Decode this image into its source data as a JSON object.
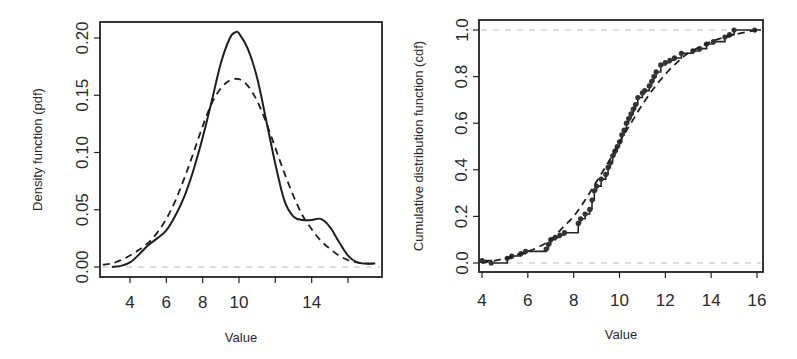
{
  "chart_data": [
    {
      "type": "line",
      "title": "",
      "xlabel": "Value",
      "ylabel": "Density function (pdf)",
      "xlim": [
        2.4,
        18.0
      ],
      "ylim": [
        -0.01,
        0.215
      ],
      "x_ticks": [
        "4",
        "6",
        "8",
        "10",
        "",
        "14",
        ""
      ],
      "x_tick_values": [
        4,
        6,
        8,
        10,
        12,
        14,
        16
      ],
      "y_ticks": [
        "0.00",
        "0.05",
        "0.10",
        "0.15",
        "0.20"
      ],
      "y_tick_values": [
        0.0,
        0.05,
        0.1,
        0.15,
        0.2
      ],
      "grid": false,
      "legend": null,
      "reference_lines": [
        {
          "y": 0.0,
          "style": "dashed",
          "color": "#bbbbbb"
        }
      ],
      "series": [
        {
          "name": "Kernel density (empirical)",
          "style": "solid",
          "x": [
            3.0,
            3.5,
            4.0,
            4.5,
            5.0,
            5.5,
            6.0,
            6.5,
            7.0,
            7.5,
            8.0,
            8.5,
            9.0,
            9.5,
            9.8,
            10.0,
            10.5,
            11.0,
            11.5,
            12.0,
            12.5,
            13.0,
            13.5,
            14.0,
            14.5,
            15.0,
            15.5,
            16.0,
            16.5,
            17.0,
            17.5
          ],
          "values": [
            0.0,
            0.001,
            0.004,
            0.011,
            0.019,
            0.025,
            0.032,
            0.045,
            0.062,
            0.085,
            0.113,
            0.145,
            0.178,
            0.2,
            0.205,
            0.204,
            0.19,
            0.165,
            0.128,
            0.09,
            0.058,
            0.044,
            0.041,
            0.041,
            0.042,
            0.035,
            0.022,
            0.01,
            0.004,
            0.003,
            0.003
          ]
        },
        {
          "name": "Fitted normal density",
          "style": "dashed",
          "x": [
            2.5,
            3.0,
            3.5,
            4.0,
            4.5,
            5.0,
            5.5,
            6.0,
            6.5,
            7.0,
            7.5,
            8.0,
            8.5,
            9.0,
            9.5,
            10.0,
            10.5,
            11.0,
            11.5,
            12.0,
            12.5,
            13.0,
            13.5,
            14.0,
            14.5,
            15.0,
            15.5,
            16.0,
            16.5,
            17.0,
            17.5
          ],
          "values": [
            0.002,
            0.003,
            0.006,
            0.01,
            0.015,
            0.021,
            0.03,
            0.042,
            0.058,
            0.078,
            0.1,
            0.123,
            0.143,
            0.156,
            0.163,
            0.164,
            0.158,
            0.145,
            0.126,
            0.104,
            0.082,
            0.062,
            0.045,
            0.033,
            0.023,
            0.016,
            0.01,
            0.006,
            0.004,
            0.003,
            0.003
          ]
        }
      ]
    },
    {
      "type": "line",
      "title": "",
      "xlabel": "Value",
      "ylabel": "Cumulative distribution function (cdf)",
      "xlim": [
        3.9,
        16.2
      ],
      "ylim": [
        -0.04,
        1.04
      ],
      "x_ticks": [
        "4",
        "6",
        "8",
        "10",
        "12",
        "14",
        "16"
      ],
      "x_tick_values": [
        4,
        6,
        8,
        10,
        12,
        14,
        16
      ],
      "y_ticks": [
        "0.0",
        "0.2",
        "0.4",
        "0.6",
        "0.8",
        "1.0"
      ],
      "y_tick_values": [
        0.0,
        0.2,
        0.4,
        0.6,
        0.8,
        1.0
      ],
      "grid": false,
      "legend": null,
      "reference_lines": [
        {
          "y": 0.0,
          "style": "dashed",
          "color": "#bbbbbb"
        },
        {
          "y": 1.0,
          "style": "dashed",
          "color": "#bbbbbb"
        }
      ],
      "series": [
        {
          "name": "Empirical CDF (step with points)",
          "style": "step-points",
          "x": [
            4.0,
            4.4,
            5.1,
            5.3,
            5.7,
            5.9,
            6.8,
            6.9,
            7.0,
            7.2,
            7.4,
            7.6,
            8.2,
            8.3,
            8.5,
            8.7,
            8.8,
            8.9,
            9.0,
            9.2,
            9.4,
            9.5,
            9.6,
            9.7,
            9.8,
            9.9,
            10.0,
            10.1,
            10.2,
            10.3,
            10.4,
            10.5,
            10.6,
            10.7,
            10.8,
            11.0,
            11.1,
            11.3,
            11.4,
            11.5,
            11.6,
            11.8,
            12.0,
            12.2,
            12.4,
            12.7,
            13.2,
            13.5,
            13.8,
            14.1,
            14.6,
            14.8,
            15.0,
            15.9
          ],
          "values": [
            0.01,
            0.0,
            0.02,
            0.03,
            0.04,
            0.05,
            0.06,
            0.08,
            0.1,
            0.11,
            0.12,
            0.13,
            0.17,
            0.19,
            0.21,
            0.23,
            0.27,
            0.31,
            0.33,
            0.36,
            0.38,
            0.41,
            0.43,
            0.46,
            0.48,
            0.5,
            0.52,
            0.55,
            0.57,
            0.6,
            0.62,
            0.64,
            0.66,
            0.68,
            0.71,
            0.73,
            0.74,
            0.76,
            0.78,
            0.8,
            0.82,
            0.85,
            0.86,
            0.87,
            0.88,
            0.9,
            0.91,
            0.92,
            0.94,
            0.95,
            0.97,
            0.98,
            1.0,
            1.0
          ]
        },
        {
          "name": "Fitted normal CDF",
          "style": "dashed",
          "x": [
            4.0,
            5.0,
            6.0,
            6.5,
            7.0,
            7.5,
            8.0,
            8.5,
            9.0,
            9.5,
            10.0,
            10.5,
            11.0,
            11.5,
            12.0,
            12.5,
            13.0,
            14.0,
            15.0,
            16.0
          ],
          "values": [
            0.0,
            0.02,
            0.05,
            0.07,
            0.1,
            0.15,
            0.2,
            0.27,
            0.35,
            0.43,
            0.52,
            0.6,
            0.68,
            0.75,
            0.81,
            0.86,
            0.9,
            0.95,
            0.98,
            1.0
          ]
        }
      ]
    }
  ]
}
